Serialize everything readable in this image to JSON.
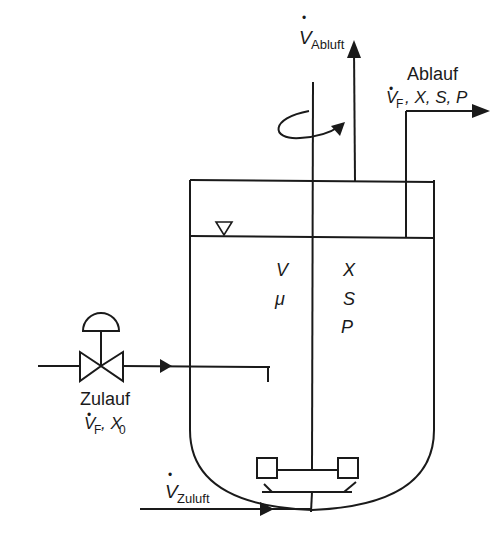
{
  "diagram": {
    "type": "bioreactor-flow-schematic",
    "labels": {
      "exhaust_air": {
        "symbol": "V",
        "dot": "•",
        "subscript": "Abluft"
      },
      "outflow": {
        "title": "Ablauf",
        "symbol": "V",
        "dot": "•",
        "subscript": "F",
        "rest": ", X, S, P"
      },
      "inflow": {
        "title": "Zulauf",
        "symbol": "V",
        "dot": "•",
        "subscript": "F",
        "rest": ", X",
        "rest_subscript": "0"
      },
      "supply_air": {
        "symbol": "V",
        "dot": "•",
        "subscript": "Zuluft"
      },
      "vessel_vars_left": [
        "V",
        "μ"
      ],
      "vessel_vars_right": [
        "X",
        "S",
        "P"
      ]
    },
    "colors": {
      "line": "#1a1a1a",
      "background": "#ffffff"
    }
  }
}
